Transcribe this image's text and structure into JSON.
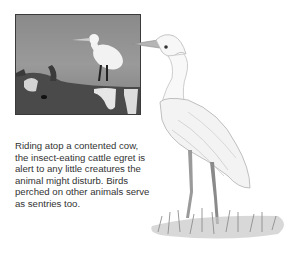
{
  "photo": {
    "subject": "cattle egret perched on cow",
    "icon": "photo-egret-on-cow"
  },
  "illustration": {
    "subject": "cattle egret standing in grass",
    "icon": "egret-drawing"
  },
  "caption": {
    "text": "Riding atop a contented cow, the insect-eating cattle egret is alert to any little creatures the animal might disturb. Birds perched on other animals serve as sentries too."
  },
  "colors": {
    "text": "#333333",
    "photo_bg": "#8a8a8a",
    "background": "#ffffff"
  }
}
